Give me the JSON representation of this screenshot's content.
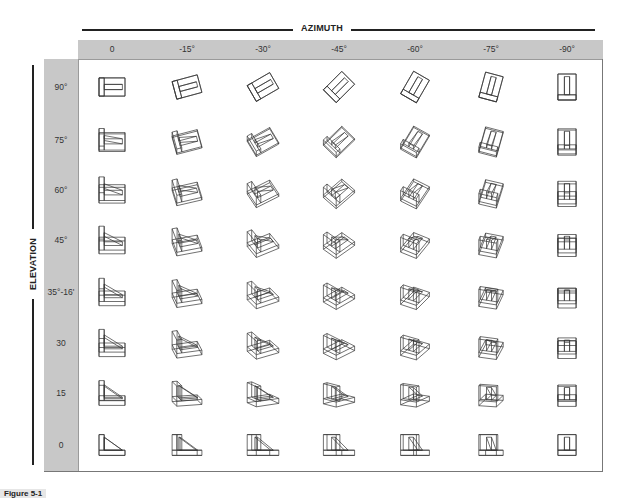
{
  "figure": {
    "azimuth_title": "AZIMUTH",
    "elevation_title": "ELEVATION",
    "caption": "Figure 5-1",
    "azimuth_columns": [
      {
        "label": "0",
        "deg": 0,
        "cx": 112
      },
      {
        "label": "-15°",
        "deg": -15,
        "cx": 187
      },
      {
        "label": "-30°",
        "deg": -30,
        "cx": 263
      },
      {
        "label": "-45°",
        "deg": -45,
        "cx": 339
      },
      {
        "label": "-60°",
        "deg": -60,
        "cx": 415
      },
      {
        "label": "-75°",
        "deg": -75,
        "cx": 491
      },
      {
        "label": "-90°",
        "deg": -90,
        "cx": 567
      }
    ],
    "elevation_rows": [
      {
        "label": "90°",
        "deg": 90,
        "cy": 87
      },
      {
        "label": "75°",
        "deg": 75,
        "cy": 140
      },
      {
        "label": "60°",
        "deg": 60,
        "cy": 190
      },
      {
        "label": "45°",
        "deg": 45,
        "cy": 240
      },
      {
        "label": "35°-16'",
        "deg": 35.27,
        "cy": 292
      },
      {
        "label": "30",
        "deg": 30,
        "cy": 343
      },
      {
        "label": "15",
        "deg": 15,
        "cy": 393
      },
      {
        "label": "0",
        "deg": 0,
        "cy": 445
      }
    ],
    "colors": {
      "band": "#c8c8c8",
      "line": "#222222",
      "drawing_stroke": "#333333"
    },
    "cell_description": "Line drawing of an L-shaped bracket with triangular gusset, viewed at the given azimuth and elevation"
  }
}
